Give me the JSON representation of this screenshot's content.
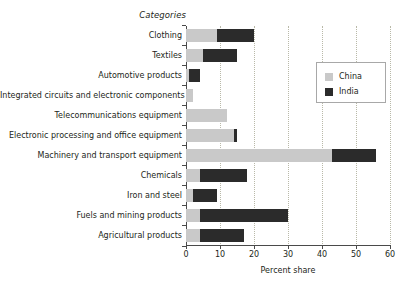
{
  "chart_data": {
    "type": "bar",
    "orientation": "horizontal",
    "stacked": false,
    "grouped": false,
    "overlay": true,
    "title": "",
    "xlabel": "Percent share",
    "ylabel": "Categories",
    "xlim": [
      0,
      60
    ],
    "xticks": [
      0,
      10,
      20,
      30,
      40,
      50,
      60
    ],
    "grid": "vertical-dotted",
    "legend_position": "upper-right-inset",
    "categories": [
      "Clothing",
      "Textiles",
      "Automotive products",
      "Integrated circuits and electronic components",
      "Telecommunications equipment",
      "Electronic  processing and office equipment",
      "Machinery and transport equipment",
      "Chemicals",
      "Iron and steel",
      "Fuels and mining products",
      "Agricultural products"
    ],
    "series": [
      {
        "name": "China",
        "color": "#c9c9c9",
        "values": [
          9,
          5,
          1,
          2,
          12,
          14,
          43,
          4,
          2,
          4,
          4
        ]
      },
      {
        "name": "India",
        "color": "#2b2b2b",
        "values": [
          20,
          15,
          4,
          0,
          0,
          15,
          56,
          18,
          9,
          30,
          17
        ]
      }
    ]
  },
  "axes": {
    "category_axis_title": "Categories",
    "value_axis_title": "Percent share",
    "xtick_labels": [
      "0",
      "10",
      "20",
      "30",
      "40",
      "50",
      "60"
    ]
  },
  "legend": {
    "entries": [
      {
        "label": "China",
        "color": "#c9c9c9"
      },
      {
        "label": "India",
        "color": "#2b2b2b"
      }
    ]
  },
  "colors": {
    "china": "#c9c9c9",
    "india": "#2b2b2b",
    "axis": "#4a4a4a",
    "grid": "#b9b9a8",
    "text": "#231f20",
    "background": "#ffffff"
  }
}
